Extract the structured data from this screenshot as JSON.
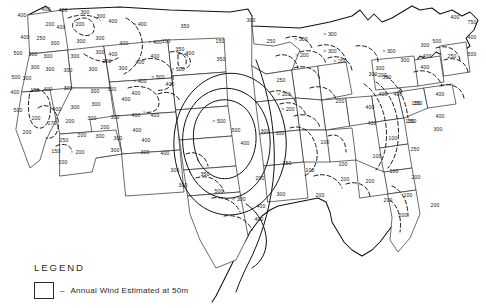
{
  "figure": {
    "kind": "contour-map",
    "region": "Contiguous United States",
    "background_color": "#ffffff",
    "line_color": "#111111",
    "state_border_color": "#2b2b2b"
  },
  "legend": {
    "title": "LEGEND",
    "dash": "–",
    "swatch_label": "Annual Wind Estimated at 50m"
  },
  "chart_data": {
    "type": "contour_map",
    "title": "Annual Wind Estimated at 50m",
    "units": "W/m2",
    "contour_levels": [
      100,
      150,
      200,
      250,
      300,
      350,
      400,
      500,
      750
    ],
    "maximum_region": "Great Plains bullseye centered over Kansas / Oklahoma panhandle",
    "maximum_label": "> 500",
    "minimum_label": "100",
    "labels": [
      {
        "t": "400",
        "x": 22,
        "y": 16
      },
      {
        "t": "400",
        "x": 46,
        "y": 10
      },
      {
        "t": "400",
        "x": 63,
        "y": 11
      },
      {
        "t": "300",
        "x": 85,
        "y": 13
      },
      {
        "t": "300",
        "x": 101,
        "y": 17
      },
      {
        "t": "400",
        "x": 113,
        "y": 22
      },
      {
        "t": "200",
        "x": 50,
        "y": 25
      },
      {
        "t": "200",
        "x": 80,
        "y": 25
      },
      {
        "t": "400",
        "x": 61,
        "y": 28
      },
      {
        "t": "> 400",
        "x": 140,
        "y": 25
      },
      {
        "t": "350",
        "x": 185,
        "y": 27
      },
      {
        "t": "300",
        "x": 251,
        "y": 21
      },
      {
        "t": "400",
        "x": 25,
        "y": 38
      },
      {
        "t": "250",
        "x": 41,
        "y": 39
      },
      {
        "t": "300",
        "x": 55,
        "y": 44
      },
      {
        "t": "300",
        "x": 81,
        "y": 42
      },
      {
        "t": "300",
        "x": 100,
        "y": 39
      },
      {
        "t": "350",
        "x": 166,
        "y": 42
      },
      {
        "t": "150",
        "x": 220,
        "y": 42
      },
      {
        "t": "250",
        "x": 271,
        "y": 42
      },
      {
        "t": "400",
        "x": 124,
        "y": 44
      },
      {
        "t": "> 400",
        "x": 155,
        "y": 43
      },
      {
        "t": "> 300",
        "x": 301,
        "y": 40
      },
      {
        "t": "> 300",
        "x": 330,
        "y": 35
      },
      {
        "t": "400",
        "x": 455,
        "y": 18
      },
      {
        "t": "750",
        "x": 472,
        "y": 23
      },
      {
        "t": "400",
        "x": 472,
        "y": 38
      },
      {
        "t": "500",
        "x": 18,
        "y": 54
      },
      {
        "t": "300",
        "x": 33,
        "y": 55
      },
      {
        "t": "300",
        "x": 48,
        "y": 57
      },
      {
        "t": "300",
        "x": 75,
        "y": 57
      },
      {
        "t": "300",
        "x": 100,
        "y": 53
      },
      {
        "t": "400",
        "x": 113,
        "y": 55
      },
      {
        "t": "250",
        "x": 107,
        "y": 62
      },
      {
        "t": "350",
        "x": 180,
        "y": 50
      },
      {
        "t": "400",
        "x": 155,
        "y": 57
      },
      {
        "t": "400",
        "x": 190,
        "y": 54
      },
      {
        "t": "350",
        "x": 221,
        "y": 60
      },
      {
        "t": "> 200",
        "x": 302,
        "y": 56
      },
      {
        "t": "> 200",
        "x": 340,
        "y": 62
      },
      {
        "t": "> 300",
        "x": 330,
        "y": 52
      },
      {
        "t": "> 300",
        "x": 389,
        "y": 52
      },
      {
        "t": "500",
        "x": 437,
        "y": 42
      },
      {
        "t": "300",
        "x": 425,
        "y": 46
      },
      {
        "t": "400",
        "x": 427,
        "y": 57
      },
      {
        "t": "250",
        "x": 452,
        "y": 57
      },
      {
        "t": "500",
        "x": 472,
        "y": 55
      },
      {
        "t": "300",
        "x": 35,
        "y": 68
      },
      {
        "t": "300",
        "x": 50,
        "y": 70
      },
      {
        "t": "300",
        "x": 68,
        "y": 71
      },
      {
        "t": "300",
        "x": 93,
        "y": 70
      },
      {
        "t": "300",
        "x": 123,
        "y": 69
      },
      {
        "t": "> 500",
        "x": 178,
        "y": 70
      },
      {
        "t": "400",
        "x": 140,
        "y": 63
      },
      {
        "t": "300",
        "x": 405,
        "y": 61
      },
      {
        "t": "300",
        "x": 380,
        "y": 69
      },
      {
        "t": "400",
        "x": 425,
        "y": 68
      },
      {
        "t": "300",
        "x": 373,
        "y": 75
      },
      {
        "t": "> 200",
        "x": 380,
        "y": 76
      },
      {
        "t": "500",
        "x": 16,
        "y": 78
      },
      {
        "t": "300",
        "x": 27,
        "y": 79
      },
      {
        "t": "150",
        "x": 35,
        "y": 91
      },
      {
        "t": "400",
        "x": 48,
        "y": 90
      },
      {
        "t": "300",
        "x": 68,
        "y": 89
      },
      {
        "t": "400",
        "x": 15,
        "y": 93
      },
      {
        "t": "300",
        "x": 95,
        "y": 92
      },
      {
        "t": "300",
        "x": 112,
        "y": 90
      },
      {
        "t": "> 400",
        "x": 140,
        "y": 82
      },
      {
        "t": "> 500",
        "x": 158,
        "y": 78
      },
      {
        "t": "400",
        "x": 170,
        "y": 85
      },
      {
        "t": "400",
        "x": 136,
        "y": 94
      },
      {
        "t": "400",
        "x": 126,
        "y": 100
      },
      {
        "t": "300",
        "x": 96,
        "y": 105
      },
      {
        "t": "150",
        "x": 416,
        "y": 104
      },
      {
        "t": "400",
        "x": 383,
        "y": 95
      },
      {
        "t": "400",
        "x": 398,
        "y": 95
      },
      {
        "t": "300",
        "x": 387,
        "y": 78
      },
      {
        "t": "400",
        "x": 440,
        "y": 95
      },
      {
        "t": "500",
        "x": 18,
        "y": 111
      },
      {
        "t": "200",
        "x": 36,
        "y": 119
      },
      {
        "t": "170",
        "x": 52,
        "y": 124
      },
      {
        "t": "400",
        "x": 57,
        "y": 110
      },
      {
        "t": "300",
        "x": 75,
        "y": 108
      },
      {
        "t": "200",
        "x": 70,
        "y": 122
      },
      {
        "t": "300",
        "x": 92,
        "y": 119
      },
      {
        "t": "300",
        "x": 115,
        "y": 118
      },
      {
        "t": "400",
        "x": 136,
        "y": 116
      },
      {
        "t": "400",
        "x": 155,
        "y": 116
      },
      {
        "t": "> 500",
        "x": 219,
        "y": 122
      },
      {
        "t": "> 200",
        "x": 288,
        "y": 110
      },
      {
        "t": "200",
        "x": 340,
        "y": 102
      },
      {
        "t": "> 200",
        "x": 284,
        "y": 95
      },
      {
        "t": "250",
        "x": 281,
        "y": 81
      },
      {
        "t": "150",
        "x": 418,
        "y": 104
      },
      {
        "t": "400",
        "x": 370,
        "y": 108
      },
      {
        "t": "400",
        "x": 440,
        "y": 117
      },
      {
        "t": "150",
        "x": 410,
        "y": 122
      },
      {
        "t": "300",
        "x": 438,
        "y": 130
      },
      {
        "t": "200",
        "x": 27,
        "y": 133
      },
      {
        "t": "250",
        "x": 64,
        "y": 141
      },
      {
        "t": "200",
        "x": 82,
        "y": 136
      },
      {
        "t": "200",
        "x": 105,
        "y": 128
      },
      {
        "t": "300",
        "x": 100,
        "y": 137
      },
      {
        "t": "300",
        "x": 118,
        "y": 139
      },
      {
        "t": "400",
        "x": 137,
        "y": 131
      },
      {
        "t": "400",
        "x": 146,
        "y": 141
      },
      {
        "t": "500",
        "x": 236,
        "y": 131
      },
      {
        "t": "300",
        "x": 265,
        "y": 132
      },
      {
        "t": "300",
        "x": 280,
        "y": 134
      },
      {
        "t": "150",
        "x": 412,
        "y": 122
      },
      {
        "t": "100",
        "x": 393,
        "y": 139
      },
      {
        "t": "400",
        "x": 372,
        "y": 124
      },
      {
        "t": "150",
        "x": 56,
        "y": 152
      },
      {
        "t": "200",
        "x": 80,
        "y": 153
      },
      {
        "t": "300",
        "x": 115,
        "y": 151
      },
      {
        "t": "300",
        "x": 145,
        "y": 153
      },
      {
        "t": "400",
        "x": 165,
        "y": 154
      },
      {
        "t": "400",
        "x": 245,
        "y": 144
      },
      {
        "t": "100",
        "x": 325,
        "y": 143
      },
      {
        "t": "250",
        "x": 415,
        "y": 150
      },
      {
        "t": "100",
        "x": 377,
        "y": 157
      },
      {
        "t": "200",
        "x": 63,
        "y": 163
      },
      {
        "t": "300",
        "x": 175,
        "y": 171
      },
      {
        "t": "350",
        "x": 205,
        "y": 175
      },
      {
        "t": "150",
        "x": 287,
        "y": 164
      },
      {
        "t": "100",
        "x": 343,
        "y": 165
      },
      {
        "t": "100",
        "x": 310,
        "y": 171
      },
      {
        "t": "300",
        "x": 183,
        "y": 186
      },
      {
        "t": "500",
        "x": 219,
        "y": 192
      },
      {
        "t": "200",
        "x": 260,
        "y": 179
      },
      {
        "t": "200",
        "x": 345,
        "y": 180
      },
      {
        "t": "200",
        "x": 370,
        "y": 182
      },
      {
        "t": "100",
        "x": 394,
        "y": 172
      },
      {
        "t": "200",
        "x": 416,
        "y": 178
      },
      {
        "t": "< 300",
        "x": 239,
        "y": 200
      },
      {
        "t": "300",
        "x": 281,
        "y": 195
      },
      {
        "t": "400",
        "x": 261,
        "y": 207
      },
      {
        "t": "200",
        "x": 320,
        "y": 196
      },
      {
        "t": "200",
        "x": 388,
        "y": 201
      },
      {
        "t": "100",
        "x": 408,
        "y": 196
      },
      {
        "t": "200",
        "x": 435,
        "y": 206
      },
      {
        "t": "400",
        "x": 259,
        "y": 220
      },
      {
        "t": "200",
        "x": 403,
        "y": 216
      }
    ]
  }
}
